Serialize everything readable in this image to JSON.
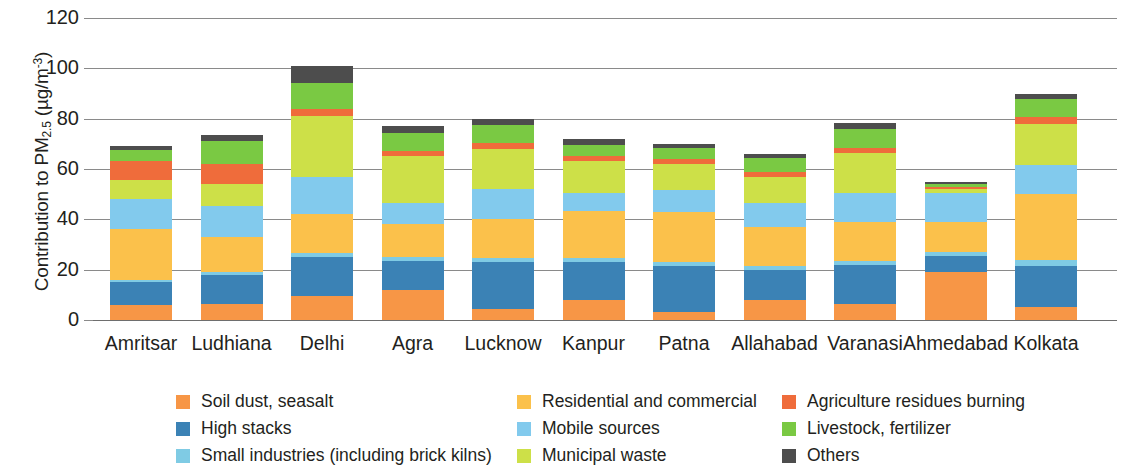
{
  "chart_data": {
    "type": "bar",
    "stacked": true,
    "title": "",
    "xlabel": "",
    "ylabel": "Contribution to PM2.5 (µg/m⁻³)",
    "ylabel_parts": {
      "prefix": "Contribution to PM",
      "subscript": "2.5",
      "unit_open": " (µg/m",
      "unit_sup": "-3",
      "unit_close": ")"
    },
    "ylim": [
      0,
      120
    ],
    "yticks": [
      0,
      20,
      40,
      60,
      80,
      100,
      120
    ],
    "ytick_labels": [
      "0",
      "20",
      "40",
      "60",
      "80",
      "100",
      "120"
    ],
    "grid": true,
    "legend_position": "bottom",
    "categories": [
      "Amritsar",
      "Ludhiana",
      "Delhi",
      "Agra",
      "Lucknow",
      "Kanpur",
      "Patna",
      "Allahabad",
      "Varanasi",
      "Ahmedabad",
      "Kolkata"
    ],
    "series": [
      {
        "name": "Soil dust, seasalt",
        "color": "#f79646",
        "values": [
          6.0,
          6.5,
          9.5,
          12.0,
          4.5,
          8.0,
          3.0,
          8.0,
          6.5,
          19.0,
          5.0
        ]
      },
      {
        "name": "High stacks",
        "color": "#3b82b5",
        "values": [
          9.0,
          11.5,
          15.5,
          11.5,
          18.5,
          15.0,
          18.5,
          12.0,
          15.5,
          6.5,
          16.5
        ]
      },
      {
        "name": "Small industries (including brick kilns)",
        "color": "#7fcbe4",
        "values": [
          1.0,
          1.0,
          1.5,
          1.5,
          1.5,
          1.5,
          1.5,
          1.5,
          1.5,
          1.5,
          2.5
        ]
      },
      {
        "name": "Residential and commercial",
        "color": "#fbc14b",
        "values": [
          20.0,
          14.0,
          15.5,
          13.0,
          15.5,
          19.0,
          20.0,
          15.5,
          15.5,
          12.0,
          26.0
        ]
      },
      {
        "name": "Mobile sources",
        "color": "#82caed",
        "values": [
          12.0,
          12.5,
          15.0,
          8.5,
          12.0,
          7.0,
          8.5,
          9.5,
          11.5,
          11.5,
          11.5
        ]
      },
      {
        "name": "Municipal waste",
        "color": "#cde048",
        "values": [
          7.5,
          8.5,
          24.0,
          18.5,
          16.0,
          12.5,
          10.5,
          10.5,
          16.0,
          1.5,
          16.5
        ]
      },
      {
        "name": "Agriculture residues burning",
        "color": "#ef6c3b",
        "values": [
          7.5,
          8.0,
          3.0,
          2.0,
          2.5,
          2.0,
          2.0,
          2.0,
          2.0,
          0.8,
          2.5
        ]
      },
      {
        "name": "Livestock, fertilizer",
        "color": "#7ac943",
        "values": [
          4.5,
          9.0,
          10.0,
          7.5,
          7.0,
          4.5,
          4.5,
          5.5,
          7.5,
          1.2,
          7.5
        ]
      },
      {
        "name": "Others",
        "color": "#4d4d4d",
        "values": [
          1.5,
          2.5,
          7.0,
          2.5,
          2.5,
          2.5,
          1.5,
          1.5,
          2.5,
          1.0,
          2.0
        ]
      }
    ],
    "totals": [
      69.0,
      73.5,
      101.0,
      77.0,
      80.0,
      72.0,
      70.0,
      66.0,
      78.5,
      55.0,
      90.0
    ]
  },
  "legend": {
    "columns": [
      [
        {
          "label": "Soil dust, seasalt",
          "color": "#f79646"
        },
        {
          "label": "High stacks",
          "color": "#3b82b5"
        },
        {
          "label": "Small industries (including brick kilns)",
          "color": "#7fcbe4"
        }
      ],
      [
        {
          "label": "Residential and commercial",
          "color": "#fbc14b"
        },
        {
          "label": "Mobile sources",
          "color": "#82caed"
        },
        {
          "label": "Municipal waste",
          "color": "#cde048"
        }
      ],
      [
        {
          "label": "Agriculture residues burning",
          "color": "#ef6c3b"
        },
        {
          "label": "Livestock, fertilizer",
          "color": "#7ac943"
        },
        {
          "label": "Others",
          "color": "#4d4d4d"
        }
      ]
    ]
  },
  "axis_colors": {
    "gridline": "#8a8a8a",
    "text": "#231f20",
    "background": "#ffffff"
  }
}
